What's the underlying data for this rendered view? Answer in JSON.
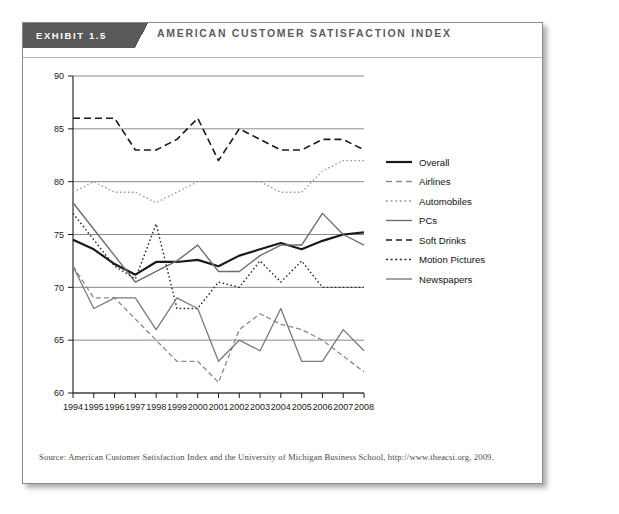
{
  "exhibit": {
    "tab_label": "EXHIBIT 1.5",
    "title": "AMERICAN CUSTOMER SATISFACTION INDEX",
    "source": "Source: American Customer Satisfaction Index and the University of Michigan Business School, http://www.theacsi.org, 2009."
  },
  "colors": {
    "tab_background": "#595959",
    "title_text": "#5c5c5c",
    "card_border": "#8b8b8b",
    "grid_line": "#8a8a8a",
    "axis_line": "#1a1a1a",
    "series_dark": "#1a1a1a",
    "series_gray": "#6e6e6e",
    "page_background": "#ffffff"
  },
  "chart_data": {
    "type": "line",
    "title": "AMERICAN CUSTOMER SATISFACTION INDEX",
    "xlabel": "",
    "ylabel": "",
    "xlim": [
      1994,
      2008
    ],
    "ylim": [
      60,
      90
    ],
    "yticks": [
      60,
      65,
      70,
      75,
      80,
      85,
      90
    ],
    "grid": "horizontal",
    "legend_position": "right",
    "categories": [
      "1994",
      "1995",
      "1996",
      "1997",
      "1998",
      "1999",
      "2000",
      "2001",
      "2002",
      "2003",
      "2004",
      "2005",
      "2006",
      "2007",
      "2008"
    ],
    "series": [
      {
        "name": "Overall",
        "style": "solid",
        "color": "#1a1a1a",
        "width": 2.2,
        "values": [
          74.5,
          73.6,
          72.2,
          71.2,
          72.4,
          72.4,
          72.6,
          72.0,
          73.0,
          73.6,
          74.2,
          73.6,
          74.4,
          75.0,
          75.2
        ]
      },
      {
        "name": "Airlines",
        "style": "dashed",
        "color": "#8a8a8a",
        "width": 1.3,
        "values": [
          72.0,
          69.0,
          69.0,
          67.0,
          65.0,
          63.0,
          63.0,
          61.0,
          66.0,
          67.5,
          66.5,
          66.0,
          65.0,
          63.5,
          62.0
        ]
      },
      {
        "name": "Automobiles",
        "style": "dotted",
        "color": "#9a9a9a",
        "width": 1.3,
        "values": [
          79.0,
          80.0,
          79.0,
          79.0,
          78.0,
          79.0,
          80.0,
          80.0,
          80.0,
          80.0,
          79.0,
          79.0,
          81.0,
          82.0,
          82.0
        ]
      },
      {
        "name": "PCs",
        "style": "solid",
        "color": "#6e6e6e",
        "width": 1.4,
        "values": [
          78.0,
          75.5,
          73.0,
          70.5,
          71.5,
          72.5,
          74.0,
          71.5,
          71.5,
          73.0,
          74.0,
          74.0,
          77.0,
          75.0,
          74.0
        ]
      },
      {
        "name": "Soft Drinks",
        "style": "dashed",
        "color": "#1a1a1a",
        "width": 1.6,
        "values": [
          86.0,
          86.0,
          86.0,
          83.0,
          83.0,
          84.0,
          86.0,
          82.0,
          85.0,
          84.0,
          83.0,
          83.0,
          84.0,
          84.0,
          83.0
        ]
      },
      {
        "name": "Motion Pictures",
        "style": "dotted",
        "color": "#2b2b2b",
        "width": 1.4,
        "values": [
          77.0,
          74.5,
          72.0,
          70.8,
          76.0,
          68.0,
          68.0,
          70.5,
          70.0,
          72.5,
          70.5,
          72.5,
          70.0,
          70.0,
          70.0
        ]
      },
      {
        "name": "Newspapers",
        "style": "solid",
        "color": "#7a7a7a",
        "width": 1.3,
        "values": [
          72.0,
          68.0,
          69.0,
          69.0,
          66.0,
          69.0,
          68.0,
          63.0,
          65.0,
          64.0,
          68.0,
          63.0,
          63.0,
          66.0,
          64.0
        ]
      }
    ]
  }
}
